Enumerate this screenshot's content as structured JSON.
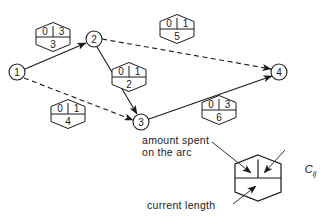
{
  "diagram": {
    "nodes": [
      {
        "id": "n1",
        "label": "1",
        "cx": 17,
        "cy": 72,
        "r": 8
      },
      {
        "id": "n2",
        "label": "2",
        "cx": 94,
        "cy": 39,
        "r": 8
      },
      {
        "id": "n3",
        "label": "3",
        "cx": 141,
        "cy": 122,
        "r": 8
      },
      {
        "id": "n4",
        "label": "4",
        "cx": 279,
        "cy": 72,
        "r": 8
      }
    ],
    "arcs": [
      {
        "id": "a13",
        "from": "n1",
        "to": "n2",
        "style": "solid",
        "x1": 25,
        "y1": 69,
        "x2": 86,
        "y2": 43
      },
      {
        "id": "a24",
        "from": "n2",
        "to": "n4",
        "style": "dashed",
        "x1": 102,
        "y1": 39,
        "x2": 271,
        "y2": 69
      },
      {
        "id": "a23",
        "from": "n2",
        "to": "n3",
        "style": "solid",
        "x1": 97,
        "y1": 47,
        "x2": 137,
        "y2": 114
      },
      {
        "id": "a12",
        "from": "n1",
        "to": "n3",
        "style": "dashed",
        "x1": 24,
        "y1": 78,
        "x2": 133,
        "y2": 120
      },
      {
        "id": "a34",
        "from": "n3",
        "to": "n4",
        "style": "solid",
        "x1": 149,
        "y1": 119,
        "x2": 272,
        "y2": 76
      }
    ],
    "hexagons": [
      {
        "id": "h-1-2",
        "for_arc": "a13",
        "cx": 53,
        "cy": 37,
        "spent": "0",
        "cij": "3",
        "length": "3"
      },
      {
        "id": "h-2-4",
        "for_arc": "a24",
        "cx": 177,
        "cy": 29,
        "spent": "0",
        "cij": "1",
        "length": "5"
      },
      {
        "id": "h-2-3",
        "for_arc": "a23",
        "cx": 129,
        "cy": 77,
        "spent": "0",
        "cij": "1",
        "length": "2"
      },
      {
        "id": "h-1-3",
        "for_arc": "a12",
        "cx": 68,
        "cy": 114,
        "spent": "0",
        "cij": "1",
        "length": "4"
      },
      {
        "id": "h-3-4",
        "for_arc": "a34",
        "cx": 219,
        "cy": 110,
        "spent": "0",
        "cij": "3",
        "length": "6"
      }
    ],
    "legend": {
      "amount_spent_line1": "amount spent",
      "amount_spent_line2": "on the arc",
      "cij_main": "C",
      "cij_sub": "ij",
      "current_length": "current length",
      "hexagon": {
        "cx": 258,
        "cy": 178
      }
    },
    "colors": {
      "stroke": "#1a1a1a",
      "background": "#ffffff",
      "text": "#1a1a1a"
    }
  }
}
